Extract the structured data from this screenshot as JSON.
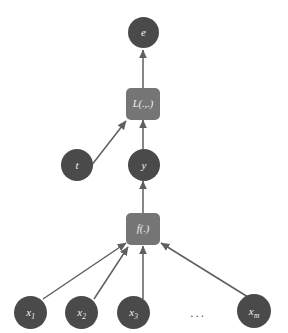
{
  "figure": {
    "background_color": "#ffffff",
    "node_color": "#4a4a4a",
    "box_color": "#757575",
    "edge_color": "#5f5f5f",
    "label_color": "#f2f2f2"
  },
  "nodes": {
    "error": {
      "label": "e",
      "name": "node-error"
    },
    "target": {
      "label": "t",
      "name": "node-target"
    },
    "output": {
      "label": "y",
      "name": "node-output"
    },
    "inputs": [
      {
        "base": "x",
        "sub": "1",
        "name": "node-input-x1"
      },
      {
        "base": "x",
        "sub": "2",
        "name": "node-input-x2"
      },
      {
        "base": "x",
        "sub": "3",
        "name": "node-input-x3"
      },
      {
        "base": "x",
        "sub": "m",
        "name": "node-input-xm"
      }
    ]
  },
  "boxes": {
    "loss": {
      "label": "L(.,.)",
      "name": "op-box-loss"
    },
    "model": {
      "label": "f(.)",
      "name": "op-box-model"
    }
  },
  "ellipsis": {
    "label": "..."
  },
  "edges": [
    {
      "from": "x1",
      "to": "f"
    },
    {
      "from": "x2",
      "to": "f"
    },
    {
      "from": "x3",
      "to": "f"
    },
    {
      "from": "xm",
      "to": "f"
    },
    {
      "from": "f",
      "to": "y"
    },
    {
      "from": "y",
      "to": "L"
    },
    {
      "from": "t",
      "to": "L"
    },
    {
      "from": "L",
      "to": "e"
    }
  ]
}
